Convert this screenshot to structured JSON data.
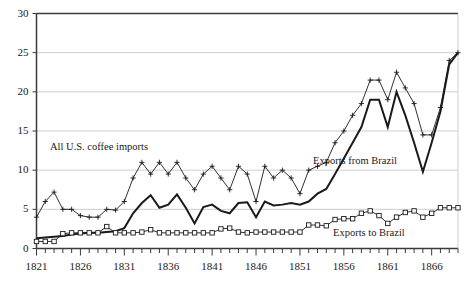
{
  "chart_data": {
    "type": "line",
    "title": "",
    "subtitle": "",
    "xlabel": "",
    "ylabel": "",
    "xlim": [
      1821,
      1869
    ],
    "ylim": [
      0,
      30
    ],
    "yticks": [
      0,
      5,
      10,
      15,
      20,
      25,
      30
    ],
    "xticks": [
      1821,
      1826,
      1831,
      1836,
      1841,
      1846,
      1851,
      1856,
      1861,
      1866
    ],
    "xtick_minor_step": 1,
    "grid": "horizontal",
    "legend": "inline-annotations",
    "x": [
      1821,
      1822,
      1823,
      1824,
      1825,
      1826,
      1827,
      1828,
      1829,
      1830,
      1831,
      1832,
      1833,
      1834,
      1835,
      1836,
      1837,
      1838,
      1839,
      1840,
      1841,
      1842,
      1843,
      1844,
      1845,
      1846,
      1847,
      1848,
      1849,
      1850,
      1851,
      1852,
      1853,
      1854,
      1855,
      1856,
      1857,
      1858,
      1859,
      1860,
      1861,
      1862,
      1863,
      1864,
      1865,
      1866,
      1867,
      1868,
      1869
    ],
    "series": [
      {
        "name": "All U.S. coffee imports",
        "marker": "plus",
        "line_weight": "thin",
        "values": [
          4.0,
          6.0,
          7.2,
          5.0,
          5.0,
          4.2,
          4.0,
          4.0,
          5.0,
          4.9,
          6.0,
          9.0,
          11.0,
          9.5,
          11.0,
          9.5,
          11.0,
          9.0,
          7.5,
          9.5,
          10.5,
          9.0,
          7.5,
          10.5,
          9.5,
          6.0,
          10.5,
          9.0,
          10.0,
          9.0,
          7.0,
          10.0,
          10.5,
          11.0,
          13.5,
          15.0,
          17.0,
          18.5,
          21.5,
          21.5,
          19.0,
          22.5,
          20.5,
          18.5,
          14.5,
          14.5,
          18.0,
          24.0,
          25.0
        ]
      },
      {
        "name": "Exports from Brazil",
        "marker": "none",
        "line_weight": "thick",
        "values": [
          1.3,
          1.4,
          1.5,
          1.6,
          1.8,
          1.9,
          2.0,
          2.0,
          2.1,
          2.2,
          2.6,
          4.5,
          5.8,
          6.8,
          5.2,
          5.6,
          6.9,
          5.2,
          3.2,
          5.3,
          5.6,
          4.8,
          4.5,
          5.8,
          5.9,
          4.0,
          6.0,
          5.5,
          5.6,
          5.8,
          5.6,
          6.0,
          7.0,
          7.6,
          9.5,
          11.5,
          13.5,
          15.5,
          19.0,
          19.0,
          15.5,
          20.0,
          17.0,
          13.5,
          9.8,
          13.5,
          17.5,
          23.5,
          25.0
        ]
      },
      {
        "name": "Exports to Brazil",
        "marker": "square",
        "line_weight": "thin",
        "values": [
          0.9,
          0.9,
          0.9,
          1.9,
          2.0,
          2.0,
          2.0,
          2.0,
          2.8,
          2.0,
          2.0,
          2.0,
          2.1,
          2.4,
          2.0,
          2.0,
          2.0,
          2.0,
          2.0,
          2.0,
          2.0,
          2.5,
          2.6,
          2.1,
          2.0,
          2.1,
          2.1,
          2.1,
          2.1,
          2.1,
          2.1,
          3.0,
          3.0,
          2.9,
          3.7,
          3.8,
          3.8,
          4.5,
          4.8,
          4.2,
          3.2,
          4.0,
          4.6,
          4.8,
          4.0,
          4.5,
          5.2,
          5.2,
          5.2
        ]
      }
    ],
    "annotations": [
      {
        "text": "All U.S. coffee imports",
        "x_px": 50,
        "y_px": 150
      },
      {
        "text": "Exports from Brazil",
        "x_px": 313,
        "y_px": 164
      },
      {
        "text": "Exports to Brazil",
        "x_px": 333,
        "y_px": 236
      }
    ]
  }
}
